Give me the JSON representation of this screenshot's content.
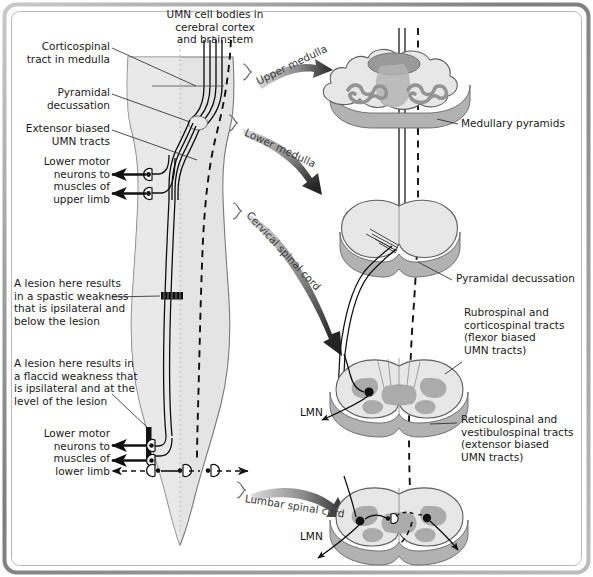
{
  "figure": {
    "type": "anatomical-diagram",
    "frame_color": "#8a8a8a",
    "background_color": "#ffffff",
    "cord_fill": "#e2e2e2",
    "cord_outline": "#6e6e6e",
    "section_top_fill": "#e8e8e8",
    "section_side_fill": "#b5b5b5",
    "gray_matter_fill": "#a9a9a9",
    "tract_color": "#111111",
    "arrow_gradient_from": "#d4d4d4",
    "arrow_gradient_to": "#2a2a2a"
  },
  "labels": {
    "umn_cell_bodies": "UMN cell bodies in\ncerebral cortex\nand brainstem",
    "corticospinal_tract": "Corticospinal\ntract in medulla",
    "pyramidal_decussation_left": "Pyramidal\ndecussation",
    "extensor_biased": "Extensor biased\nUMN tracts",
    "lmn_upper_limb": "Lower motor\nneurons to\nmuscles of\nupper limb",
    "lesion_spastic": "A lesion here results\nin a spastic weakness\nthat is ipsilateral and\nbelow the lesion",
    "lesion_flaccid": "A lesion here results in\na flaccid weakness that\nis ipsilateral and at the\nlevel of the lesion",
    "lmn_lower_limb": "Lower motor\nneurons to\nmuscles of\nlower limb",
    "medullary_pyramids": "Medullary pyramids",
    "pyramidal_decussation_right": "Pyramidal decussation",
    "rubrospinal": "Rubrospinal and\ncorticospinal tracts\n(flexor biased\nUMN tracts)",
    "reticulospinal": "Reticulospinal and\nvestibulospinal tracts\n(extensor biased\nUMN tracts)",
    "lmn_cervical": "LMN",
    "lmn_lumbar": "LMN"
  },
  "arrows": [
    {
      "id": "upper-medulla",
      "label": "Upper medulla",
      "from_level": "upper medulla",
      "to_section": "medulla-cross-section"
    },
    {
      "id": "lower-medulla",
      "label": "Lower medulla",
      "from_level": "lower medulla",
      "to_section": "decussation-cross-section"
    },
    {
      "id": "cervical-spinal-cord",
      "label": "Cervical spinal cord",
      "from_level": "cervical",
      "to_section": "cervical-cross-section"
    },
    {
      "id": "lumbar-spinal-cord",
      "label": "Lumbar spinal cord",
      "from_level": "lumbar",
      "to_section": "lumbar-cross-section"
    }
  ],
  "cross_sections": [
    {
      "id": "medulla-cross-section",
      "name": "Upper medulla",
      "callout": "Medullary pyramids"
    },
    {
      "id": "decussation-cross-section",
      "name": "Lower medulla",
      "callout": "Pyramidal decussation"
    },
    {
      "id": "cervical-cross-section",
      "name": "Cervical spinal cord",
      "callout": "Rubrospinal and corticospinal tracts (flexor biased UMN tracts)"
    },
    {
      "id": "lumbar-cross-section",
      "name": "Lumbar spinal cord",
      "callout": "Reticulospinal and vestibulospinal tracts (extensor biased UMN tracts)"
    }
  ]
}
